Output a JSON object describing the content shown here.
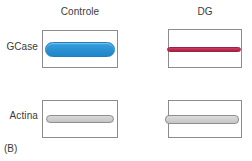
{
  "figure": {
    "panel_caption": "(B)",
    "background_color": "#ffffff",
    "border_color": "#8c8c8c",
    "text_color": "#3b3b3b"
  },
  "columns": [
    {
      "key": "controle",
      "label": "Controle"
    },
    {
      "key": "dg",
      "label": "DG"
    }
  ],
  "rows": [
    {
      "key": "gcase",
      "label": "GCase"
    },
    {
      "key": "actina",
      "label": "Actina"
    }
  ],
  "blots": {
    "gcase_controle": {
      "row": "GCase",
      "column": "Controle",
      "band_color": "#2c92d4",
      "band_outline": "#1d7fbe",
      "intensity": "strong",
      "thickness": "thick"
    },
    "gcase_dg": {
      "row": "GCase",
      "column": "DG",
      "band_color": "#b92b4f",
      "band_outline": "#9e2046",
      "intensity": "faint",
      "thickness": "thin"
    },
    "actina_controle": {
      "row": "Actina",
      "column": "Controle",
      "band_color": "#cfcfcf",
      "band_outline": "#8f8f8f",
      "intensity": "moderate",
      "thickness": "medium"
    },
    "actina_dg": {
      "row": "Actina",
      "column": "DG",
      "band_color": "#d0d0d0",
      "band_outline": "#8f8f8f",
      "intensity": "moderate",
      "thickness": "medium"
    }
  },
  "chart_data": {
    "type": "table",
    "title": "(B)",
    "categories": [
      "Controle",
      "DG"
    ],
    "series": [
      {
        "name": "GCase",
        "values": [
          1.0,
          0.15
        ],
        "band_colors": [
          "#2c92d4",
          "#b92b4f"
        ]
      },
      {
        "name": "Actina",
        "values": [
          1.0,
          1.0
        ],
        "band_colors": [
          "#cfcfcf",
          "#d0d0d0"
        ]
      }
    ],
    "xlabel": "",
    "ylabel": "",
    "grid": false,
    "legend": "none"
  }
}
